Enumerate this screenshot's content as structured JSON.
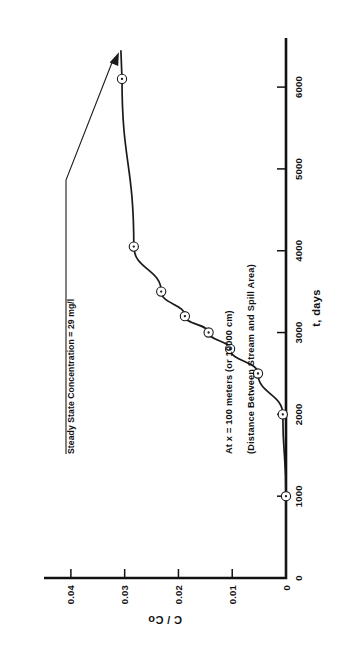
{
  "figure": {
    "title_line_1": "At x = 100 meters (or 10000 cm)",
    "title_line_2": "(Distance Between Stream and Spill Area)",
    "annotation": "Steady State Concentration = 29 mg/l"
  },
  "chart_data": {
    "type": "line",
    "title": "At x = 100 meters (or 10000 cm)",
    "subtitle": "(Distance Between Stream and Spill Area)",
    "xlabel": "t, days",
    "ylabel": "C / Co",
    "xlim": [
      0,
      6600
    ],
    "ylim": [
      0,
      0.045
    ],
    "grid": false,
    "legend": "none",
    "orientation": "rotated-90-ccw",
    "xticks": [
      0,
      1000,
      2000,
      3000,
      4000,
      5000,
      6000
    ],
    "xticklabels": [
      "0",
      "1000",
      "2000",
      "3000",
      "4000",
      "5000",
      "6000"
    ],
    "yticks": [
      0,
      0.01,
      0.02,
      0.03,
      0.04
    ],
    "yticklabels": [
      "0",
      "0.01",
      "0.02",
      "0.03",
      "0.04"
    ],
    "marker": "circle-with-dot",
    "x": [
      1000,
      2000,
      2500,
      2800,
      3000,
      3200,
      3500,
      4050,
      6100
    ],
    "y": [
      0.0,
      0.0006,
      0.0052,
      0.0104,
      0.0144,
      0.0188,
      0.0232,
      0.0283,
      0.0305
    ],
    "annotations": [
      {
        "text": "Steady State Concentration = 29 mg/l",
        "points_to_x": 6450,
        "points_to_y": 0.0307
      }
    ]
  }
}
